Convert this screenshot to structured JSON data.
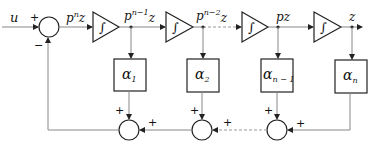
{
  "diagram": {
    "input_label": "u",
    "output_label": "z",
    "input_summer": {
      "plus_sign": "+",
      "minus_sign": "−"
    },
    "integrator_symbol": "∫",
    "signals": [
      {
        "base": "p",
        "sup": "n",
        "tail": "z"
      },
      {
        "base": "p",
        "sup": "n−1",
        "tail": "z"
      },
      {
        "base": "p",
        "sup": "n−2",
        "tail": "z"
      },
      {
        "base": "p",
        "sup": "",
        "tail": "z"
      },
      {
        "base": "",
        "sup": "",
        "tail": "z"
      }
    ],
    "gains": [
      {
        "base": "α",
        "sub": "1"
      },
      {
        "base": "α",
        "sub": "2"
      },
      {
        "base": "α",
        "sub": "n − 1"
      },
      {
        "base": "α",
        "sub": "n"
      }
    ],
    "feedback_summers": [
      {
        "top_sign": "+",
        "right_sign": "+"
      },
      {
        "top_sign": "+",
        "right_sign": "+"
      },
      {
        "top_sign": "+",
        "right_sign": "+"
      }
    ],
    "colors": {
      "line": "#888888",
      "shape_stroke": "#222222",
      "text": "#111111"
    }
  }
}
